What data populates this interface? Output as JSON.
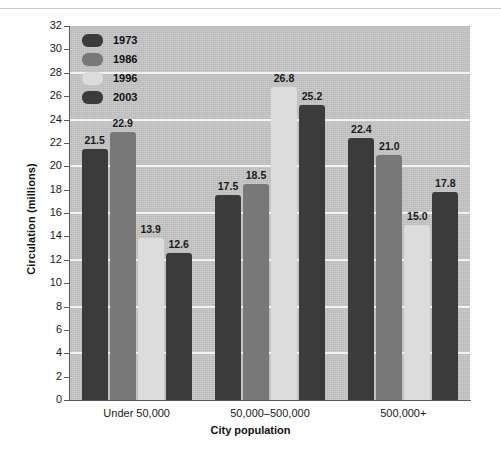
{
  "chart_data": {
    "type": "bar",
    "title": "",
    "xlabel": "City population",
    "ylabel": "Circulation (millions)",
    "categories": [
      "Under 50,000",
      "50,000–500,000",
      "500,000+"
    ],
    "series": [
      {
        "name": "1973",
        "color": "#3b3b3b",
        "values": [
          21.5,
          17.5,
          22.4
        ]
      },
      {
        "name": "1986",
        "color": "#787878",
        "values": [
          22.9,
          18.5,
          21.0
        ]
      },
      {
        "name": "1996",
        "color": "#dcdcdc",
        "values": [
          13.9,
          26.8,
          15.0
        ]
      },
      {
        "name": "2003",
        "color": "#3b3b3b",
        "values": [
          12.6,
          25.2,
          17.8
        ]
      }
    ],
    "ylim": [
      0,
      32
    ],
    "ytick_step": 2,
    "yticks": [
      0,
      2,
      4,
      6,
      8,
      10,
      12,
      14,
      16,
      18,
      20,
      22,
      24,
      26,
      28,
      30,
      32
    ],
    "ytick_labels": [
      "0",
      "2",
      "4",
      "6",
      "8",
      "10",
      "12",
      "14",
      "16",
      "18",
      "20",
      "22",
      "24",
      "26",
      "28",
      "30",
      "32"
    ],
    "gridlines_at": [
      4,
      8,
      12,
      16,
      20,
      24,
      28
    ],
    "grid": true,
    "legend_position": "top-left-inside",
    "value_labels": [
      "21.5",
      "22.9",
      "13.9",
      "12.6",
      "17.5",
      "18.5",
      "26.8",
      "25.2",
      "22.4",
      "21.0",
      "15.0",
      "17.8"
    ],
    "plot_background": "#c6c6c6",
    "gridline_color": "#f2f2f2",
    "axis_color": "#5a5a5a"
  },
  "legend": {
    "items": [
      {
        "label": "1973"
      },
      {
        "label": "1986"
      },
      {
        "label": "1996"
      },
      {
        "label": "2003"
      }
    ]
  }
}
